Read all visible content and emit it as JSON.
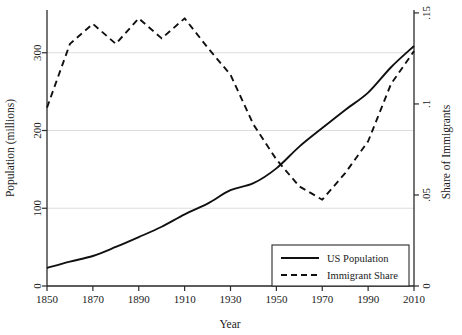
{
  "chart_data": {
    "type": "line",
    "title": "",
    "xlabel": "Year",
    "ylabel": "Population (millions)",
    "y2label": "Share of Immigrants",
    "grid": true,
    "legend_position": "bottom-right",
    "xlim": [
      1850,
      2010
    ],
    "ylim": [
      0,
      355
    ],
    "y2lim": [
      0,
      0.1516
    ],
    "xticks": [
      1850,
      1870,
      1890,
      1910,
      1930,
      1950,
      1970,
      1990,
      2010
    ],
    "xtick_labels": [
      "1850",
      "1870",
      "1890",
      "1910",
      "1930",
      "1950",
      "1970",
      "1990",
      "2010"
    ],
    "yticks": [
      0,
      100,
      200,
      300
    ],
    "ytick_labels": [
      "0",
      "100",
      "200",
      "300"
    ],
    "y2ticks": [
      0,
      0.05,
      0.1,
      0.15
    ],
    "y2tick_labels": [
      "0",
      ".05",
      ".1",
      ".15"
    ],
    "x": [
      1850,
      1860,
      1870,
      1880,
      1890,
      1900,
      1910,
      1920,
      1930,
      1940,
      1950,
      1960,
      1970,
      1980,
      1990,
      2000,
      2010
    ],
    "series": [
      {
        "name": "US Population",
        "axis": "left",
        "style": "solid",
        "color": "#101010",
        "values": [
          23.2,
          31.4,
          38.6,
          50.2,
          62.9,
          76.2,
          92.2,
          106.0,
          123.2,
          132.2,
          151.3,
          179.3,
          203.2,
          226.5,
          248.7,
          281.4,
          308.7
        ]
      },
      {
        "name": "Immigrant Share",
        "axis": "right",
        "style": "dashed",
        "color": "#101010",
        "values": [
          0.098,
          0.133,
          0.144,
          0.133,
          0.147,
          0.136,
          0.147,
          0.131,
          0.116,
          0.0887,
          0.0695,
          0.0547,
          0.0474,
          0.062,
          0.0795,
          0.111,
          0.129
        ]
      }
    ]
  },
  "legend": {
    "entries": [
      {
        "label": "US Population",
        "style": "solid"
      },
      {
        "label": "Immigrant Share",
        "style": "dashed"
      }
    ]
  }
}
